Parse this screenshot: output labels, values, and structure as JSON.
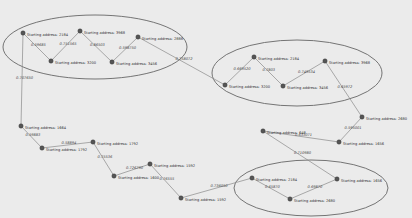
{
  "diagram": {
    "type": "weighted-graph",
    "clusters": [
      {
        "id": "c1",
        "cx": 95,
        "cy": 47,
        "rx": 92,
        "ry": 32
      },
      {
        "id": "c2",
        "cx": 297,
        "cy": 73,
        "rx": 85,
        "ry": 33
      },
      {
        "id": "c3",
        "cx": 311,
        "cy": 188,
        "rx": 77,
        "ry": 28
      }
    ],
    "nodes": [
      {
        "id": "A",
        "x": 23,
        "y": 33,
        "label": "Starting address: 2184"
      },
      {
        "id": "B",
        "x": 51,
        "y": 61,
        "label": "Starting address: 3200"
      },
      {
        "id": "C",
        "x": 80,
        "y": 31,
        "label": "Starting address: 3968"
      },
      {
        "id": "D",
        "x": 112,
        "y": 62,
        "label": "Starting address: 3456"
      },
      {
        "id": "E",
        "x": 138,
        "y": 37,
        "label": "Starting address: 2888"
      },
      {
        "id": "F",
        "x": 225,
        "y": 85,
        "label": "Starting address: 3200"
      },
      {
        "id": "G",
        "x": 254,
        "y": 57,
        "label": "Starting address: 2184"
      },
      {
        "id": "H",
        "x": 283,
        "y": 86,
        "label": "Starting address: 3456"
      },
      {
        "id": "I",
        "x": 325,
        "y": 61,
        "label": "Starting address: 3968"
      },
      {
        "id": "J",
        "x": 362,
        "y": 117,
        "label": "Starting address: 2680"
      },
      {
        "id": "K",
        "x": 339,
        "y": 142,
        "label": "Starting address: 1656"
      },
      {
        "id": "L",
        "x": 263,
        "y": 131,
        "label": "Starting address: 648"
      },
      {
        "id": "M",
        "x": 337,
        "y": 179,
        "label": "Starting address: 1656"
      },
      {
        "id": "N",
        "x": 290,
        "y": 199,
        "label": "Starting address: 2680"
      },
      {
        "id": "O",
        "x": 252,
        "y": 178,
        "label": "Starting address: 2184"
      },
      {
        "id": "P",
        "x": 181,
        "y": 198,
        "label": "Starting address: 1592"
      },
      {
        "id": "Q",
        "x": 150,
        "y": 164,
        "label": "Starting address: 1592"
      },
      {
        "id": "R",
        "x": 114,
        "y": 176,
        "label": "Starting address: 1600"
      },
      {
        "id": "S",
        "x": 93,
        "y": 142,
        "label": "Starting address: 1792"
      },
      {
        "id": "T",
        "x": 42,
        "y": 148,
        "label": "Starting address: 1792"
      },
      {
        "id": "U",
        "x": 21,
        "y": 126,
        "label": "Starting address: 1664"
      }
    ],
    "edges": [
      {
        "from": "A",
        "to": "B",
        "weight": "0.59685"
      },
      {
        "from": "B",
        "to": "C",
        "weight": "0.751565"
      },
      {
        "from": "C",
        "to": "D",
        "weight": "0.86503"
      },
      {
        "from": "D",
        "to": "E",
        "weight": "0.598750"
      },
      {
        "from": "E",
        "to": "F",
        "weight": "0.758072"
      },
      {
        "from": "F",
        "to": "G",
        "weight": "0.669520"
      },
      {
        "from": "G",
        "to": "H",
        "weight": "0.7803"
      },
      {
        "from": "H",
        "to": "I",
        "weight": "0.749534"
      },
      {
        "from": "I",
        "to": "J",
        "weight": "0.65972"
      },
      {
        "from": "J",
        "to": "K",
        "weight": "0.595001"
      },
      {
        "from": "K",
        "to": "L",
        "weight": "0.633071"
      },
      {
        "from": "L",
        "to": "M",
        "weight": "0.710980"
      },
      {
        "from": "M",
        "to": "N",
        "weight": "0.69870"
      },
      {
        "from": "N",
        "to": "O",
        "weight": "0.65870"
      },
      {
        "from": "O",
        "to": "P",
        "weight": "0.736050"
      },
      {
        "from": "P",
        "to": "Q",
        "weight": "0.76555"
      },
      {
        "from": "Q",
        "to": "R",
        "weight": "0.726790"
      },
      {
        "from": "R",
        "to": "S",
        "weight": "0.75536"
      },
      {
        "from": "S",
        "to": "T",
        "weight": "0.58894"
      },
      {
        "from": "T",
        "to": "U",
        "weight": "0.59883"
      },
      {
        "from": "U",
        "to": "A",
        "weight": "0.707650"
      }
    ]
  }
}
